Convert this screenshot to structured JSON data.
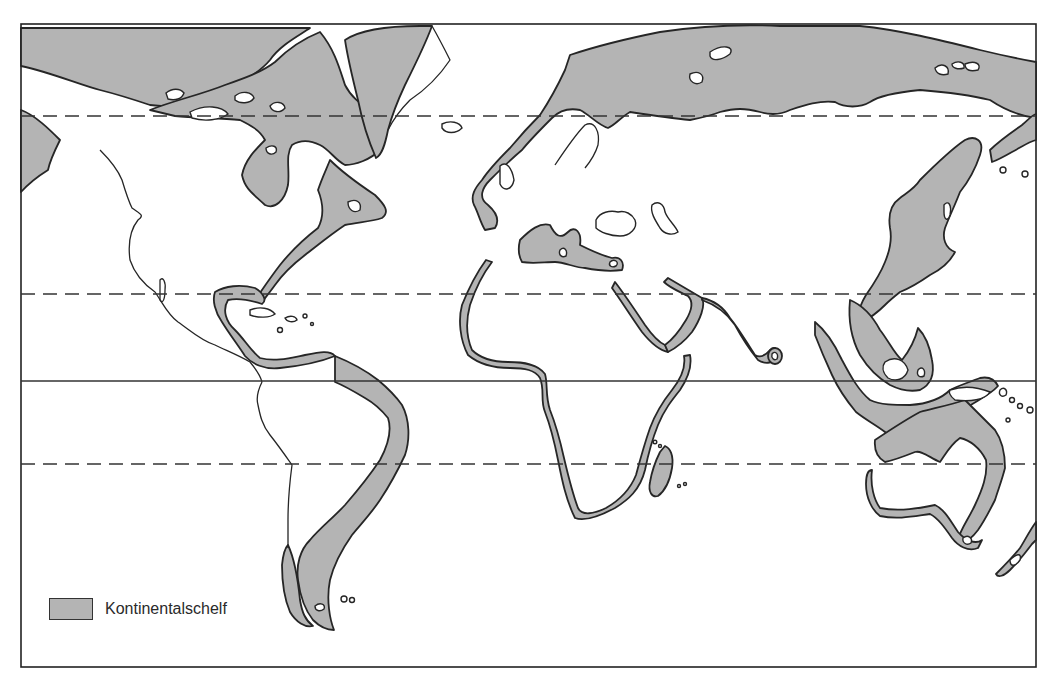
{
  "map": {
    "title": "",
    "projection": "world map (Mercator-like), Pacific-split",
    "fill_color_shelf": "#b4b4b4",
    "outline_color": "#262626",
    "latitude_lines": [
      {
        "name": "arctic-circle",
        "style": "dashed",
        "y": 116
      },
      {
        "name": "tropic-of-cancer",
        "style": "dashed",
        "y": 294
      },
      {
        "name": "equator",
        "style": "solid",
        "y": 381
      },
      {
        "name": "tropic-of-capricorn",
        "style": "dashed",
        "y": 464
      }
    ],
    "regions_shown": [
      "North America",
      "Greenland",
      "South America",
      "Europe",
      "Africa",
      "Asia",
      "Indonesia",
      "Australia",
      "New Zealand",
      "Madagascar",
      "Japan",
      "Caribbean",
      "Arctic Ocean shelf"
    ]
  },
  "legend": {
    "items": [
      {
        "label": "Kontinentalschelf",
        "color": "#b4b4b4"
      }
    ]
  }
}
